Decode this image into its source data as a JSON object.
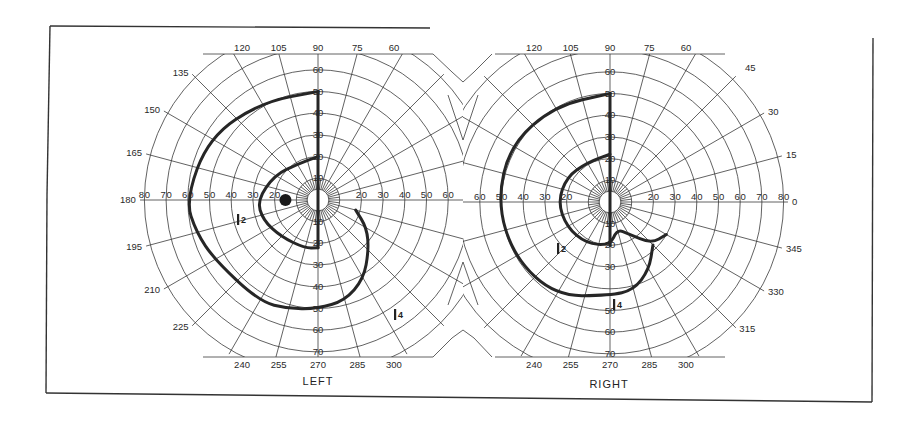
{
  "chart_data": {
    "type": "polar",
    "title": "",
    "angle_labels": [
      0,
      15,
      30,
      45,
      60,
      75,
      90,
      105,
      120,
      135,
      150,
      165,
      180,
      195,
      210,
      225,
      240,
      255,
      270,
      285,
      300,
      315,
      330,
      345
    ],
    "radial_labels": [
      10,
      20,
      30,
      40,
      50,
      60,
      70,
      80
    ],
    "radial_unit": "degrees eccentricity",
    "panels": [
      {
        "name": "LEFT",
        "blind_spot": {
          "angle": 180,
          "eccentricity": 15
        },
        "isopters": [
          {
            "label": "I2",
            "points": [
              [
                90,
                20
              ],
              [
                120,
                19
              ],
              [
                150,
                23
              ],
              [
                180,
                28
              ],
              [
                200,
                27
              ],
              [
                225,
                24
              ],
              [
                255,
                23
              ],
              [
                270,
                22
              ]
            ]
          },
          {
            "label": "I4",
            "points": [
              [
                90,
                50
              ],
              [
                120,
                52
              ],
              [
                150,
                58
              ],
              [
                180,
                61
              ],
              [
                195,
                58
              ],
              [
                210,
                55
              ],
              [
                240,
                54
              ],
              [
                255,
                52
              ],
              [
                270,
                50
              ],
              [
                285,
                48
              ],
              [
                300,
                42
              ],
              [
                315,
                33
              ],
              [
                330,
                26
              ],
              [
                345,
                18
              ]
            ]
          }
        ]
      },
      {
        "name": "RIGHT",
        "isopters": [
          {
            "label": "I2",
            "points": [
              [
                90,
                22
              ],
              [
                120,
                21
              ],
              [
                150,
                23
              ],
              [
                180,
                24
              ],
              [
                210,
                23
              ],
              [
                240,
                22
              ],
              [
                270,
                20
              ],
              [
                285,
                13
              ],
              [
                300,
                17
              ],
              [
                315,
                27
              ],
              [
                330,
                30
              ]
            ]
          },
          {
            "label": "I4",
            "points": [
              [
                90,
                50
              ],
              [
                120,
                51
              ],
              [
                150,
                53
              ],
              [
                180,
                52
              ],
              [
                210,
                51
              ],
              [
                240,
                50
              ],
              [
                270,
                43
              ],
              [
                285,
                42
              ],
              [
                300,
                36
              ],
              [
                315,
                28
              ]
            ]
          }
        ]
      }
    ],
    "grid": true
  },
  "panels": {
    "left": {
      "name": "LEFT",
      "top_labels": [
        "120",
        "105",
        "90",
        "75",
        "60"
      ],
      "side_labels": [
        "135",
        "150",
        "165",
        "180",
        "195",
        "210",
        "225"
      ],
      "bottom_labels": [
        "240",
        "255",
        "270",
        "285",
        "300"
      ],
      "axis_h_left": [
        "80",
        "70",
        "60",
        "50",
        "40",
        "30",
        "20"
      ],
      "axis_h_right": [
        "20",
        "30",
        "40",
        "50",
        "60"
      ],
      "axis_v_up": [
        "10",
        "20",
        "30",
        "40",
        "50",
        "60"
      ],
      "axis_v_down": [
        "10",
        "20",
        "30",
        "40",
        "50",
        "60",
        "70"
      ],
      "isopter_labels": [
        "I2",
        "I4"
      ]
    },
    "right": {
      "name": "RIGHT",
      "top_labels": [
        "120",
        "105",
        "90",
        "75",
        "60",
        "45"
      ],
      "side_labels": [
        "30",
        "15",
        "0",
        "345",
        "330",
        "315"
      ],
      "bottom_labels": [
        "240",
        "255",
        "270",
        "285",
        "300"
      ],
      "axis_h_left": [
        "60",
        "50",
        "40",
        "30",
        "20"
      ],
      "axis_h_right": [
        "20",
        "30",
        "40",
        "50",
        "60",
        "70",
        "80"
      ],
      "axis_v_up": [
        "10",
        "20",
        "30",
        "40",
        "50",
        "60"
      ],
      "axis_v_down": [
        "10",
        "20",
        "30",
        "50",
        "60",
        "70"
      ],
      "isopter_labels": [
        "I2",
        "I4"
      ]
    }
  }
}
